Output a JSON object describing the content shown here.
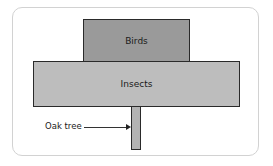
{
  "diagram": {
    "type": "pyramid-of-numbers",
    "levels": [
      {
        "label": "Birds",
        "level": "top",
        "color": "#9a9a9a"
      },
      {
        "label": "Insects",
        "level": "middle",
        "color": "#bdbdbd"
      },
      {
        "label": "",
        "level": "bottom",
        "color": "#b3b3b3"
      }
    ],
    "annotation": {
      "label": "Oak tree",
      "points_to": "bottom"
    }
  }
}
